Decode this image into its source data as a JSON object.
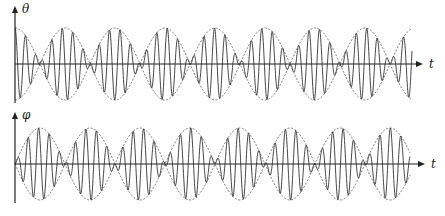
{
  "figure": {
    "panels": [
      {
        "id": "theta",
        "y_label": "θ",
        "x_label": "t",
        "axis_y": 64,
        "y_axis_top": 6,
        "y_axis_bottom": 103,
        "x_start": 15,
        "x_axis_end": 423,
        "curve_end": 412,
        "amplitude": 36,
        "envelope_period_px": 100,
        "envelope_type": "cos",
        "envelope_phase_x": 15,
        "carrier_period_px": 10.5
      },
      {
        "id": "phi",
        "y_label": "φ",
        "x_label": "t",
        "axis_y": 164,
        "y_axis_top": 112,
        "y_axis_bottom": 203,
        "x_start": 15,
        "x_axis_end": 425,
        "curve_end": 410,
        "amplitude": 36,
        "envelope_period_px": 100,
        "envelope_type": "sin",
        "envelope_phase_x": 15,
        "carrier_period_px": 10.5
      }
    ],
    "colors": {
      "stroke": "#333333",
      "envelope": "#555555",
      "axis": "#222222"
    }
  }
}
